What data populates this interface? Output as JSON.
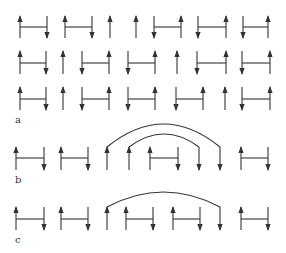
{
  "figure": {
    "colors": {
      "line": "#333333",
      "background": "#ffffff"
    },
    "panels": [
      {
        "label": "a",
        "label_pos": [
          15,
          123
        ],
        "rows": [
          {
            "y_top": 16,
            "y_bottom": 38,
            "y_bar": 27,
            "spins": [
              {
                "x": 20,
                "dir": "up"
              },
              {
                "x": 47,
                "dir": "down"
              },
              {
                "x": 65,
                "dir": "up"
              },
              {
                "x": 92,
                "dir": "down"
              },
              {
                "x": 110,
                "dir": "up"
              },
              {
                "x": 136,
                "dir": "up"
              },
              {
                "x": 154,
                "dir": "down"
              },
              {
                "x": 181,
                "dir": "up"
              },
              {
                "x": 198,
                "dir": "down"
              },
              {
                "x": 226,
                "dir": "up"
              },
              {
                "x": 243,
                "dir": "down"
              },
              {
                "x": 268,
                "dir": "up"
              }
            ],
            "bonds": [
              [
                20,
                47
              ],
              [
                65,
                92
              ],
              [
                154,
                181
              ],
              [
                198,
                226
              ],
              [
                243,
                268
              ]
            ]
          },
          {
            "y_top": 51,
            "y_bottom": 74,
            "y_bar": 63,
            "spins": [
              {
                "x": 20,
                "dir": "up"
              },
              {
                "x": 46,
                "dir": "down"
              },
              {
                "x": 63,
                "dir": "up"
              },
              {
                "x": 82,
                "dir": "down"
              },
              {
                "x": 109,
                "dir": "up"
              },
              {
                "x": 128,
                "dir": "down"
              },
              {
                "x": 155,
                "dir": "up"
              },
              {
                "x": 177,
                "dir": "up"
              },
              {
                "x": 197,
                "dir": "down"
              },
              {
                "x": 226,
                "dir": "up"
              },
              {
                "x": 242,
                "dir": "down"
              },
              {
                "x": 270,
                "dir": "up"
              }
            ],
            "bonds": [
              [
                20,
                46
              ],
              [
                82,
                109
              ],
              [
                128,
                155
              ],
              [
                197,
                226
              ],
              [
                242,
                270
              ]
            ]
          },
          {
            "y_top": 87,
            "y_bottom": 110,
            "y_bar": 99,
            "spins": [
              {
                "x": 20,
                "dir": "up"
              },
              {
                "x": 46,
                "dir": "down"
              },
              {
                "x": 63,
                "dir": "up"
              },
              {
                "x": 82,
                "dir": "down"
              },
              {
                "x": 109,
                "dir": "up"
              },
              {
                "x": 128,
                "dir": "down"
              },
              {
                "x": 155,
                "dir": "up"
              },
              {
                "x": 176,
                "dir": "down"
              },
              {
                "x": 203,
                "dir": "up"
              },
              {
                "x": 225,
                "dir": "up"
              },
              {
                "x": 242,
                "dir": "down"
              },
              {
                "x": 270,
                "dir": "up"
              }
            ],
            "bonds": [
              [
                20,
                46
              ],
              [
                82,
                109
              ],
              [
                128,
                155
              ],
              [
                176,
                203
              ],
              [
                242,
                270
              ]
            ]
          }
        ]
      },
      {
        "label": "b",
        "label_pos": [
          15,
          183
        ],
        "rows": [
          {
            "y_top": 147,
            "y_bottom": 170,
            "y_bar": 158,
            "spins": [
              {
                "x": 16,
                "dir": "up"
              },
              {
                "x": 44,
                "dir": "down"
              },
              {
                "x": 61,
                "dir": "up"
              },
              {
                "x": 88,
                "dir": "down"
              },
              {
                "x": 107,
                "dir": "up"
              },
              {
                "x": 129,
                "dir": "up"
              },
              {
                "x": 150,
                "dir": "up"
              },
              {
                "x": 178,
                "dir": "down"
              },
              {
                "x": 199,
                "dir": "down"
              },
              {
                "x": 220,
                "dir": "down"
              },
              {
                "x": 241,
                "dir": "up"
              },
              {
                "x": 268,
                "dir": "down"
              }
            ],
            "bonds": [
              [
                16,
                44
              ],
              [
                61,
                88
              ],
              [
                150,
                178
              ],
              [
                241,
                268
              ]
            ],
            "arcs": [
              {
                "from": 107,
                "to": 220,
                "peak_y": 124
              },
              {
                "from": 129,
                "to": 199,
                "peak_y": 134
              }
            ]
          }
        ]
      },
      {
        "label": "c",
        "label_pos": [
          15,
          243
        ],
        "rows": [
          {
            "y_top": 207,
            "y_bottom": 230,
            "y_bar": 219,
            "spins": [
              {
                "x": 16,
                "dir": "up"
              },
              {
                "x": 44,
                "dir": "down"
              },
              {
                "x": 61,
                "dir": "up"
              },
              {
                "x": 88,
                "dir": "down"
              },
              {
                "x": 107,
                "dir": "up"
              },
              {
                "x": 126,
                "dir": "up"
              },
              {
                "x": 153,
                "dir": "down"
              },
              {
                "x": 173,
                "dir": "up"
              },
              {
                "x": 200,
                "dir": "down"
              },
              {
                "x": 220,
                "dir": "down"
              },
              {
                "x": 241,
                "dir": "up"
              },
              {
                "x": 268,
                "dir": "down"
              }
            ],
            "bonds": [
              [
                16,
                44
              ],
              [
                61,
                88
              ],
              [
                126,
                153
              ],
              [
                173,
                200
              ],
              [
                241,
                268
              ]
            ],
            "arcs": [
              {
                "from": 107,
                "to": 220,
                "peak_y": 192
              }
            ]
          }
        ]
      }
    ]
  }
}
